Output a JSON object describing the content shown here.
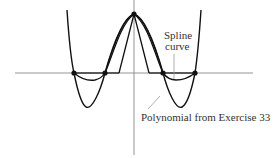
{
  "figure": {
    "title": "",
    "labels": {
      "spline_line1": "Spline",
      "spline_line2": "curve",
      "polynomial": "Polynomial from Exercise 33"
    },
    "colors": {
      "axis": "#888888",
      "curve": "#111111",
      "leader": "#999999",
      "text": "#333333",
      "background": "#ffffff"
    },
    "axes": {
      "x_axis_y": 73,
      "x_axis_from": 15,
      "x_axis_to": 253,
      "y_axis_x": 134,
      "y_axis_from": 0,
      "y_axis_to": 155
    },
    "points": [
      {
        "name": "peak",
        "x": 134,
        "y": 14
      },
      {
        "name": "node-1",
        "x": 74,
        "y": 73
      },
      {
        "name": "node-2",
        "x": 105,
        "y": 73
      },
      {
        "name": "node-3",
        "x": 163,
        "y": 73
      },
      {
        "name": "node-4",
        "x": 195,
        "y": 73
      }
    ],
    "curves": [
      {
        "name": "polynomial",
        "description": "Degree-4 interpolating polynomial with deep minima between outer nodes, steep outer arms"
      },
      {
        "name": "spline-curve",
        "description": "Cubic spline through the nodes, shallow dips between outer node pairs"
      },
      {
        "name": "piecewise-linear",
        "description": "Triangle from axis to peak"
      },
      {
        "name": "smooth-hump",
        "description": "Second smooth curve through peak"
      }
    ]
  }
}
